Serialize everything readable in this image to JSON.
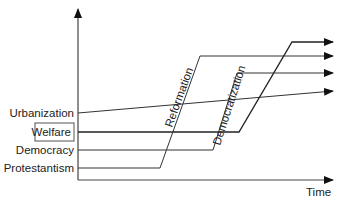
{
  "diagram": {
    "axes": {
      "x_label": "Time"
    },
    "series": [
      {
        "name": "Urbanization",
        "boxed": false
      },
      {
        "name": "Welfare",
        "boxed": true
      },
      {
        "name": "Democracy",
        "boxed": false
      },
      {
        "name": "Protestantism",
        "boxed": false
      }
    ],
    "transitions": [
      {
        "label": "Reformation"
      },
      {
        "label": "Democratization"
      }
    ],
    "colors": {
      "line": "#333333",
      "text": "#222222",
      "background": "#ffffff"
    }
  }
}
